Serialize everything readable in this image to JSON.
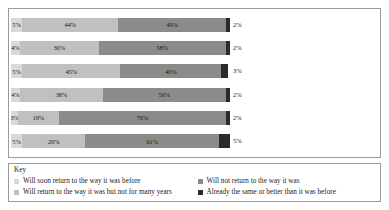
{
  "chart_data": {
    "type": "bar",
    "orientation": "horizontal",
    "stacked": true,
    "stack_total": "100%",
    "title": "",
    "subtitle": "",
    "xlabel": "",
    "ylabel": "",
    "xlim": [
      0,
      100
    ],
    "grid": false,
    "legend_position": "bottom",
    "legend_title": "Key",
    "categories": [
      "A low unemployment rate",
      "Workers feeling secure in their jobs",
      "Workers not having to take jobs below their skill level",
      "The availability of good jobs for good pay for people who want to work",
      "Older workers being able to retire when they want to",
      "The ability of young people to afford college"
    ],
    "series": [
      {
        "name": "Will soon return to the way it was before",
        "color": "#d9d9d7",
        "values": [
          5,
          4,
          5,
          4,
          3,
          5
        ],
        "labels": [
          "5%",
          "4%",
          "5%",
          "4%",
          "3%",
          "5%"
        ]
      },
      {
        "name": "Will return to the way it was but not for many years",
        "color": "#c0c0be",
        "values": [
          44,
          36,
          45,
          38,
          19,
          29
        ],
        "labels": [
          "44%",
          "36%",
          "45%",
          "38%",
          "19%",
          "29%"
        ]
      },
      {
        "name": "Will not return to the way it was",
        "color": "#8b8b89",
        "values": [
          49,
          58,
          46,
          56,
          76,
          61
        ],
        "labels": [
          "49%",
          "58%",
          "46%",
          "56%",
          "76%",
          "61%"
        ]
      },
      {
        "name": "Already the same or better than it was before",
        "color": "#2b2b29",
        "values": [
          2,
          2,
          3,
          2,
          2,
          5
        ],
        "labels": [
          "2%",
          "2%",
          "3%",
          "2%",
          "2%",
          "5%"
        ]
      }
    ]
  },
  "rows": [
    {
      "label": "A low unemployment rate",
      "label_lines": [
        "A low unemployment rate"
      ],
      "segments": [
        {
          "value": 5,
          "label": "5%"
        },
        {
          "value": 44,
          "label": "44%"
        },
        {
          "value": 49,
          "label": "49%"
        },
        {
          "value": 2,
          "label": "2%"
        }
      ]
    },
    {
      "label": "Workers feeling secure in their jobs",
      "label_lines": [
        "Workers feeling secure in",
        "their jobs"
      ],
      "segments": [
        {
          "value": 4,
          "label": "4%"
        },
        {
          "value": 36,
          "label": "36%"
        },
        {
          "value": 58,
          "label": "58%"
        },
        {
          "value": 2,
          "label": "2%"
        }
      ]
    },
    {
      "label": "Workers not having to take jobs below their skill level",
      "label_lines": [
        "Workers not having to take jobs",
        "below their skill level"
      ],
      "segments": [
        {
          "value": 5,
          "label": "5%"
        },
        {
          "value": 45,
          "label": "45%"
        },
        {
          "value": 46,
          "label": "46%"
        },
        {
          "value": 3,
          "label": "3%"
        }
      ]
    },
    {
      "label": "The availability of good jobs for good pay for people who want to work",
      "label_lines": [
        "The availability of good jobs for good",
        "pay for people who want to work"
      ],
      "segments": [
        {
          "value": 4,
          "label": "4%"
        },
        {
          "value": 38,
          "label": "38%"
        },
        {
          "value": 56,
          "label": "56%"
        },
        {
          "value": 2,
          "label": "2%"
        }
      ]
    },
    {
      "label": "Older workers being able to retire when they want to",
      "label_lines": [
        "Older workers being able to retire",
        "when they want to"
      ],
      "segments": [
        {
          "value": 3,
          "label": "3%"
        },
        {
          "value": 19,
          "label": "19%"
        },
        {
          "value": 76,
          "label": "76%"
        },
        {
          "value": 2,
          "label": "2%"
        }
      ]
    },
    {
      "label": "The ability of young people to afford college",
      "label_lines": [
        "The ability of young people to",
        "afford college"
      ],
      "segments": [
        {
          "value": 5,
          "label": "5%"
        },
        {
          "value": 29,
          "label": "29%"
        },
        {
          "value": 61,
          "label": "61%"
        },
        {
          "value": 5,
          "label": "5%"
        }
      ]
    }
  ],
  "legend": {
    "title": "Key",
    "items": [
      {
        "label": "Will soon return to the way it was before",
        "color": "#d9d9d7"
      },
      {
        "label": "Will not return to the way it was",
        "color": "#8b8b89"
      },
      {
        "label": "Will return to the way it was but not for many years",
        "color": "#c0c0be"
      },
      {
        "label": "Already the same or better than it was before",
        "color": "#2b2b29"
      }
    ]
  }
}
